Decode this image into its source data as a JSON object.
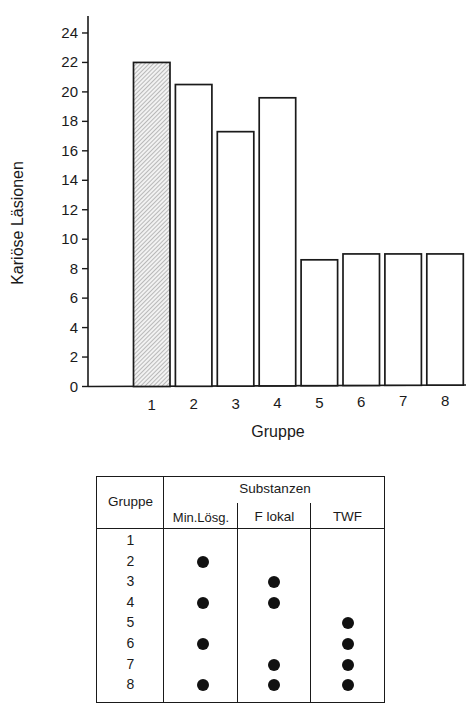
{
  "chart_data": {
    "type": "bar",
    "title": "",
    "xlabel": "Gruppe",
    "ylabel": "Kariöse Läsionen",
    "categories": [
      "1",
      "2",
      "3",
      "4",
      "5",
      "6",
      "7",
      "8"
    ],
    "values": [
      22.0,
      20.5,
      17.3,
      19.6,
      8.6,
      9.0,
      9.0,
      9.0
    ],
    "highlighted_category": "1",
    "bar_styles": [
      "hatched",
      "plain",
      "plain",
      "plain",
      "plain",
      "plain",
      "plain",
      "plain"
    ],
    "ylim": [
      0,
      24
    ],
    "yticks": [
      0,
      2,
      4,
      6,
      8,
      10,
      12,
      14,
      16,
      18,
      20,
      22,
      24
    ],
    "grid": false,
    "legend_position": "table below chart",
    "colors": {
      "bar_fill": "#ffffff",
      "bar_hatch": "#6e6e6e",
      "bar_stroke": "#1a1a1a",
      "axis": "#1a1a1a"
    }
  },
  "table": {
    "header": {
      "group_label": "Gruppe",
      "substances_label": "Substanzen",
      "columns": [
        "Min.Lösg.",
        "F lokal",
        "TWF"
      ]
    },
    "rows": [
      {
        "group": "1",
        "min_loesg": false,
        "f_lokal": false,
        "twf": false
      },
      {
        "group": "2",
        "min_loesg": true,
        "f_lokal": false,
        "twf": false
      },
      {
        "group": "3",
        "min_loesg": false,
        "f_lokal": true,
        "twf": false
      },
      {
        "group": "4",
        "min_loesg": true,
        "f_lokal": true,
        "twf": false
      },
      {
        "group": "5",
        "min_loesg": false,
        "f_lokal": false,
        "twf": true
      },
      {
        "group": "6",
        "min_loesg": true,
        "f_lokal": false,
        "twf": true
      },
      {
        "group": "7",
        "min_loesg": false,
        "f_lokal": true,
        "twf": true
      },
      {
        "group": "8",
        "min_loesg": true,
        "f_lokal": true,
        "twf": true
      }
    ]
  }
}
